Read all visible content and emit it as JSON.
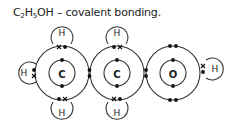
{
  "title": {
    "formula_parts": [
      "C",
      "2",
      "H",
      "5",
      "OH"
    ],
    "suffix": " – covalent bonding."
  },
  "atoms": {
    "carbon_1": {
      "symbol": "C"
    },
    "carbon_2": {
      "symbol": "C"
    },
    "oxygen": {
      "symbol": "O"
    },
    "hydrogens": [
      {
        "symbol": "H",
        "position": "left of C1"
      },
      {
        "symbol": "H",
        "position": "top of C1"
      },
      {
        "symbol": "H",
        "position": "bottom of C1"
      },
      {
        "symbol": "H",
        "position": "top of C2"
      },
      {
        "symbol": "H",
        "position": "bottom of C2"
      },
      {
        "symbol": "H",
        "position": "right of O"
      }
    ]
  },
  "colors": {
    "line": "#333333",
    "electron": "#111111",
    "background": "#ffffff"
  }
}
